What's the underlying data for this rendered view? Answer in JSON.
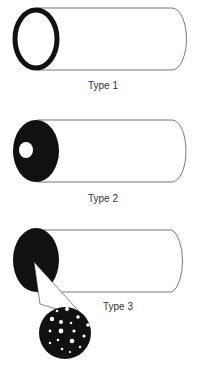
{
  "diagram": {
    "panels": [
      {
        "label": "Type 1",
        "description": "Hollow tube with thin dark ring end"
      },
      {
        "label": "Type 2",
        "description": "Tube with solid dark end and single white hole"
      },
      {
        "label": "Type 3",
        "description": "Tube with solid dark end, magnified view showing many small pores"
      }
    ]
  }
}
